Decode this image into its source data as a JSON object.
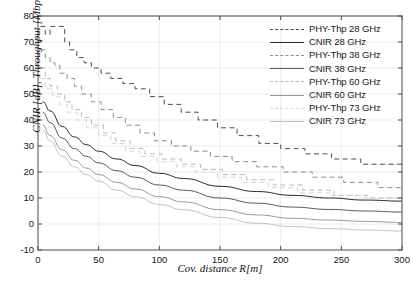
{
  "chart_data": {
    "type": "line",
    "title": "",
    "xlabel": "Cov. distance R[m]",
    "ylabel": "CNIR [dB], Throughput [Mbps]",
    "xlim": [
      0,
      300
    ],
    "ylim": [
      -10,
      80
    ],
    "xticks": [
      0,
      50,
      100,
      150,
      200,
      250,
      300
    ],
    "yticks": [
      -10,
      0,
      10,
      20,
      30,
      40,
      50,
      60,
      70,
      80
    ],
    "grid": true,
    "legend_position": "upper right",
    "series": [
      {
        "name": "PHY-Thp 28 GHz",
        "style": "dashed-step",
        "color": "#4d4d4d",
        "x": [
          2,
          6,
          10,
          14,
          18,
          22,
          26,
          32,
          38,
          44,
          52,
          60,
          70,
          80,
          92,
          104,
          118,
          132,
          148,
          164,
          182,
          200,
          220,
          242,
          266,
          300
        ],
        "y": [
          76,
          73,
          76,
          76,
          76,
          70,
          67,
          64,
          62,
          60,
          58,
          56,
          54,
          52,
          49,
          46,
          43,
          40,
          37,
          34,
          31,
          29,
          27,
          25,
          23,
          22
        ]
      },
      {
        "name": "CNIR 28 GHz",
        "style": "solid",
        "color": "#2b2b2b",
        "x": [
          4,
          10,
          20,
          30,
          40,
          50,
          65,
          80,
          100,
          120,
          150,
          180,
          210,
          240,
          270,
          300
        ],
        "y": [
          47,
          43.5,
          37.5,
          33.5,
          30.5,
          28,
          25,
          22.5,
          19.5,
          17.5,
          14.5,
          12.5,
          11,
          10,
          9.2,
          8.8
        ]
      },
      {
        "name": "PHY-Thp 38 GHz",
        "style": "dashed-step",
        "color": "#8c8c8c",
        "x": [
          2,
          6,
          10,
          14,
          18,
          24,
          30,
          36,
          44,
          52,
          62,
          72,
          84,
          96,
          110,
          126,
          142,
          160,
          180,
          202,
          226,
          252,
          280,
          300
        ],
        "y": [
          67,
          64,
          62,
          61,
          58,
          56,
          53,
          50,
          47,
          44,
          41,
          38,
          35,
          32,
          30,
          28,
          26,
          24,
          22,
          20,
          18,
          16,
          14,
          13
        ]
      },
      {
        "name": "CNIR 38 GHz",
        "style": "solid",
        "color": "#5a5a5a",
        "x": [
          4,
          10,
          20,
          30,
          40,
          50,
          65,
          80,
          100,
          120,
          150,
          180,
          210,
          240,
          270,
          300
        ],
        "y": [
          43,
          39,
          33,
          29,
          26,
          23.5,
          20.5,
          18,
          15,
          13,
          10,
          8,
          6.5,
          5.6,
          5,
          4.6
        ]
      },
      {
        "name": "PHY-Thp 60 GHz",
        "style": "dashed-step",
        "color": "#b8b8b8",
        "x": [
          2,
          6,
          10,
          16,
          22,
          28,
          36,
          44,
          54,
          64,
          76,
          88,
          102,
          118,
          134,
          152,
          172,
          194,
          218,
          244,
          272,
          300
        ],
        "y": [
          60,
          56,
          53,
          50,
          47,
          44,
          41,
          38,
          35,
          32,
          29,
          27,
          25,
          23,
          21,
          19,
          17,
          15,
          13,
          11,
          10,
          9
        ]
      },
      {
        "name": "CNIR 60 GHz",
        "style": "solid",
        "color": "#9a9a9a",
        "x": [
          4,
          10,
          20,
          30,
          40,
          50,
          65,
          80,
          100,
          120,
          150,
          180,
          210,
          240,
          270,
          300
        ],
        "y": [
          38,
          34,
          28.5,
          24.5,
          21.5,
          19,
          16,
          13.5,
          10.5,
          8.5,
          5.5,
          3.5,
          2.2,
          1.5,
          1,
          0.6
        ]
      },
      {
        "name": "PHY-Thp 73 GHz",
        "style": "dashed-step",
        "color": "#d6d6d6",
        "x": [
          2,
          6,
          12,
          18,
          24,
          32,
          40,
          50,
          60,
          72,
          84,
          98,
          114,
          130,
          148,
          168,
          190,
          214,
          240,
          268,
          300
        ],
        "y": [
          56,
          52,
          49,
          46,
          43,
          40,
          37,
          34,
          31,
          28,
          26,
          24,
          22,
          20,
          18,
          16,
          14,
          12,
          11,
          10,
          9
        ]
      },
      {
        "name": "CNIR 73 GHz",
        "style": "solid",
        "color": "#c2c2c2",
        "x": [
          4,
          10,
          20,
          30,
          40,
          50,
          65,
          80,
          100,
          120,
          150,
          180,
          210,
          240,
          270,
          300
        ],
        "y": [
          36,
          32,
          26,
          22,
          19,
          16.5,
          13,
          10.5,
          7.5,
          5.5,
          2.5,
          0.3,
          -1,
          -1.8,
          -2.3,
          -2.7
        ]
      }
    ]
  },
  "axes": {
    "xlabel": "Cov. distance R[m]",
    "ylabel": "CNIR [dB], Throughput [Mbps]",
    "xticklabels": [
      "0",
      "50",
      "100",
      "150",
      "200",
      "250",
      "300"
    ],
    "yticklabels": [
      "-10",
      "0",
      "10",
      "20",
      "30",
      "40",
      "50",
      "60",
      "70",
      "80"
    ]
  },
  "legend": {
    "entries": [
      {
        "label": "PHY-Thp 28 GHz",
        "color": "#4d4d4d",
        "style": "dashed"
      },
      {
        "label": "CNIR 28 GHz",
        "color": "#2b2b2b",
        "style": "solid"
      },
      {
        "label": "PHY-Thp 38 GHz",
        "color": "#8c8c8c",
        "style": "dashed"
      },
      {
        "label": "CNIR 38 GHz",
        "color": "#5a5a5a",
        "style": "solid"
      },
      {
        "label": "PHY-Thp 60 GHz",
        "color": "#b8b8b8",
        "style": "dashed"
      },
      {
        "label": "CNIR 60 GHz",
        "color": "#9a9a9a",
        "style": "solid"
      },
      {
        "label": "PHY-Thp 73 GHz",
        "color": "#d6d6d6",
        "style": "dashed"
      },
      {
        "label": "CNIR 73 GHz",
        "color": "#c2c2c2",
        "style": "solid"
      }
    ]
  },
  "style": {
    "axis_color": "#4a4a4a",
    "grid_color": "#e6e6e6",
    "background": "#ffffff"
  }
}
